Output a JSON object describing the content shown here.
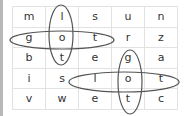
{
  "puzzle": {
    "type": "word-search",
    "grid": [
      [
        "m",
        "l",
        "s",
        "u",
        "n"
      ],
      [
        "g",
        "o",
        "t",
        "r",
        "z"
      ],
      [
        "b",
        "t",
        "e",
        "g",
        "a"
      ],
      [
        "i",
        "s",
        "l",
        "o",
        "t"
      ],
      [
        "v",
        "w",
        "e",
        "t",
        "c"
      ]
    ],
    "found_words": [
      {
        "word": "lot",
        "direction": "vertical",
        "col": 1,
        "rows": [
          0,
          2
        ]
      },
      {
        "word": "got",
        "direction": "horizontal",
        "row": 1,
        "cols": [
          0,
          2
        ]
      },
      {
        "word": "got",
        "direction": "vertical",
        "col": 3,
        "rows": [
          2,
          4
        ]
      },
      {
        "word": "lot",
        "direction": "horizontal",
        "row": 3,
        "cols": [
          2,
          4
        ]
      }
    ],
    "circle_color": "#555555"
  }
}
